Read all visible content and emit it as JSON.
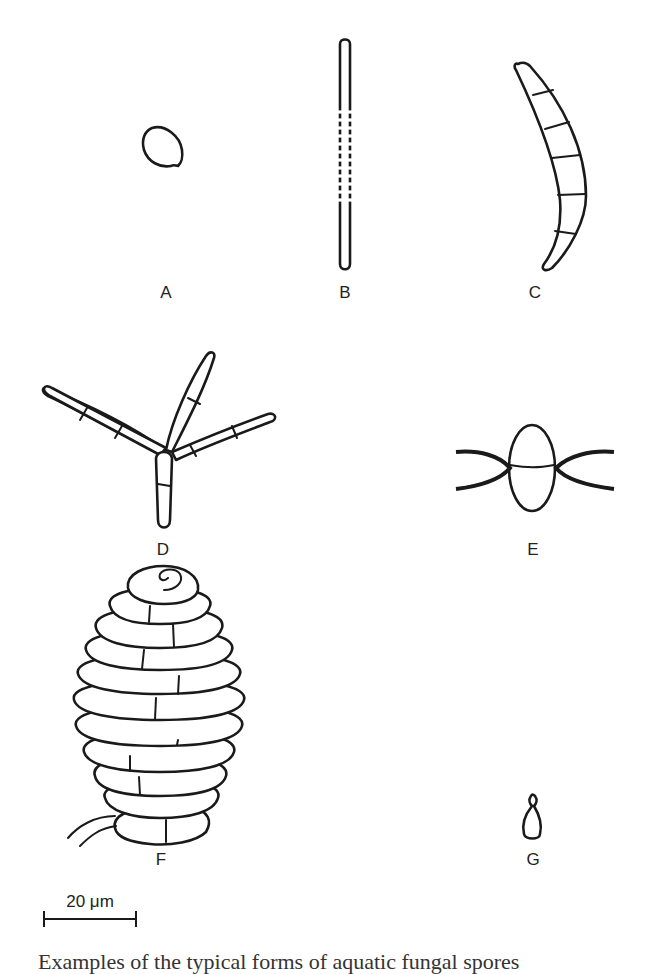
{
  "figure": {
    "panels": [
      {
        "id": "A",
        "label": "A",
        "shape": "ovoid spore"
      },
      {
        "id": "B",
        "label": "B",
        "shape": "filiform/sigmoid long thin conidium"
      },
      {
        "id": "C",
        "label": "C",
        "shape": "curved septate (falcate) conidium"
      },
      {
        "id": "D",
        "label": "D",
        "shape": "tetraradiate conidium"
      },
      {
        "id": "E",
        "label": "E",
        "shape": "ellipsoid with appendages"
      },
      {
        "id": "F",
        "label": "F",
        "shape": "helicoid coiled conidium"
      },
      {
        "id": "G",
        "label": "G",
        "shape": "small clavate spore"
      }
    ],
    "scale_bar": {
      "label": "20 μm"
    },
    "caption": "Examples of the typical forms of aquatic fungal spores"
  }
}
